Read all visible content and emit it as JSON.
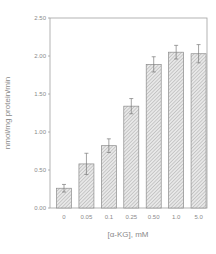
{
  "chart_data": {
    "type": "bar",
    "title": "",
    "xlabel": "[α-KG], mM",
    "ylabel": "nmol/mg protein/min",
    "categories": [
      "0",
      "0.05",
      "0.1",
      "0.25",
      "0.50",
      "1.0",
      "5.0"
    ],
    "values": [
      0.26,
      0.58,
      0.82,
      1.34,
      1.89,
      2.05,
      2.03
    ],
    "errors": [
      0.05,
      0.14,
      0.09,
      0.1,
      0.1,
      0.09,
      0.12
    ],
    "ylim": [
      0,
      2.5
    ],
    "yticks": [
      "0.00",
      "0.50",
      "1.00",
      "1.50",
      "2.00",
      "2.50"
    ],
    "grid": false,
    "legend": null,
    "bar_fill": "hatched",
    "colors": {
      "axis": "#9a9a9a",
      "bar_edge": "#8c8c8c",
      "hatch": "#a8a8a8",
      "text": "#8a8a8a"
    }
  }
}
